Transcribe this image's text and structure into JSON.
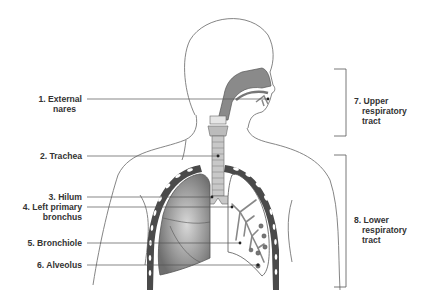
{
  "diagram": {
    "colors": {
      "line": "#555555",
      "lung_fill": "#8c8c8c",
      "tissue": "#bdbdbd",
      "rib": "#4a4a4a",
      "background": "#ffffff"
    },
    "labels_left": [
      {
        "num": "1.",
        "line1": "External",
        "line2": "nares"
      },
      {
        "num": "2.",
        "line1": "Trachea",
        "line2": ""
      },
      {
        "num": "3.",
        "line1": "Hilum",
        "line2": ""
      },
      {
        "num": "4.",
        "line1": "Left primary",
        "line2": "bronchus"
      },
      {
        "num": "5.",
        "line1": "Bronchiole",
        "line2": ""
      },
      {
        "num": "6.",
        "line1": "Alveolus",
        "line2": ""
      }
    ],
    "labels_right": [
      {
        "num": "7.",
        "line1": "Upper",
        "line2": "respiratory",
        "line3": "tract"
      },
      {
        "num": "8.",
        "line1": "Lower",
        "line2": "respiratory",
        "line3": "tract"
      }
    ]
  }
}
